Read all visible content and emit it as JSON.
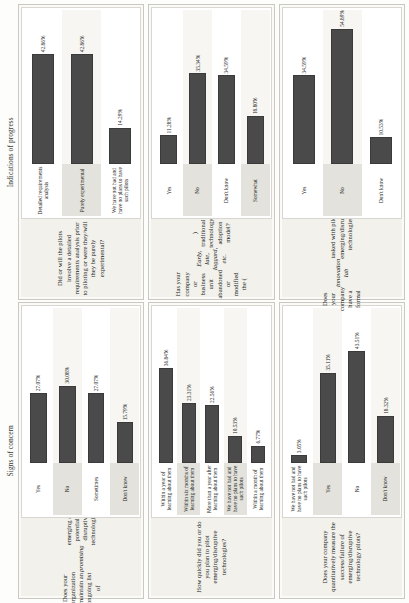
{
  "page": {
    "orientation": "rotated-90-ccw",
    "bar_color": "#4a4a4a",
    "page_background": "#fdfdfb"
  },
  "sections": [
    {
      "id": "signs-of-concern",
      "title": "Signs of concern",
      "charts": [
        {
          "id": "ongoing-list",
          "chart_data": {
            "type": "bar",
            "title": "Does your organization maintain an ongoing list of promising emerging and potentially disruptive technologies?",
            "title_parts": [
              {
                "text": "Does your organization maintain an ongoing list of ",
                "style": "normal"
              },
              {
                "text": "promising",
                "style": "italic"
              },
              {
                "text": " emerging and potentially disruptive technologies?",
                "style": "normal"
              }
            ],
            "orientation": "horizontal",
            "categories": [
              "Yes",
              "No",
              "Sometimes",
              "Don't know"
            ],
            "values": [
              27.07,
              30.08,
              27.07,
              15.79
            ],
            "labels": [
              "27.07%",
              "30.08%",
              "27.07%",
              "15.79%"
            ],
            "xlabel": "",
            "ylabel": "",
            "xlim": [
              0,
              60
            ],
            "grid": false,
            "legend": false
          }
        },
        {
          "id": "how-quickly-pilot",
          "chart_data": {
            "type": "bar",
            "title": "How quickly did you or do you plan to pilot emerging/disruptive technologies?",
            "title_parts": [
              {
                "text": "How quickly did you or do you plan to pilot emerging/disruptive technologies?",
                "style": "normal"
              }
            ],
            "orientation": "horizontal",
            "categories": [
              "Within a year of learning about them",
              "Within six months of learning about them",
              "More than a year after learning about them",
              "We have not had and have no plans to have such pilots",
              "Within a month of learning about them"
            ],
            "values": [
              36.84,
              23.31,
              22.56,
              10.53,
              6.77
            ],
            "labels": [
              "36.84%",
              "23.31%",
              "22.56%",
              "10.53%",
              "6.77%"
            ],
            "xlabel": "",
            "ylabel": "",
            "xlim": [
              0,
              60
            ],
            "grid": false,
            "legend": false
          }
        },
        {
          "id": "quantitative-measure",
          "chart_data": {
            "type": "bar",
            "title": "Does your company quantitatively measure the success/failure of emerging/disruptive technology pilots?",
            "title_parts": [
              {
                "text": "Does your company quantitatively measure the success/failure of emerging/disruptive technology pilots?",
                "style": "normal"
              }
            ],
            "orientation": "horizontal",
            "categories": [
              "We have not had and have no plans to have such pilots",
              "Yes",
              "No",
              "Don't know"
            ],
            "values": [
              3.05,
              35.11,
              43.51,
              18.32
            ],
            "labels": [
              "3.05%",
              "35.11%",
              "43.51%",
              "18.32%"
            ],
            "xlabel": "",
            "ylabel": "",
            "xlim": [
              0,
              60
            ],
            "grid": false,
            "legend": false
          }
        }
      ]
    },
    {
      "id": "indications-of-progress",
      "title": "Indications of progress",
      "charts": [
        {
          "id": "requirements-analysis",
          "chart_data": {
            "type": "bar",
            "title": "Did or will the pilots involve a detailed requirements analysis prior to piloting or were they/will they be purely experimental?",
            "title_parts": [
              {
                "text": "Did or will the pilots involve a detailed requirements analysis prior to piloting or were they/will they be purely experimental?",
                "style": "normal"
              }
            ],
            "orientation": "horizontal",
            "categories": [
              "Detailed requirements analysis",
              "Purely experimental",
              "We have not had and have no plans to have such pilots"
            ],
            "values": [
              42.86,
              42.86,
              14.29
            ],
            "labels": [
              "42.86%",
              "42.86%",
              "14.29%"
            ],
            "xlabel": "",
            "ylabel": "",
            "xlim": [
              0,
              60
            ],
            "grid": false,
            "legend": false
          }
        },
        {
          "id": "abandoned-adoption-model",
          "chart_data": {
            "type": "bar",
            "title": "Has your company or business unit abandoned or modified the (Early, late, laggard, etc.) traditional technology adoption model?",
            "title_parts": [
              {
                "text": "Has your company or business unit abandoned or modified the (",
                "style": "normal"
              },
              {
                "text": "Early, late, laggard, etc.",
                "style": "italic"
              },
              {
                "text": ") traditional technology adoption model?",
                "style": "normal"
              }
            ],
            "orientation": "horizontal",
            "categories": [
              "Yes",
              "No",
              "Don't know",
              "Somewhat"
            ],
            "values": [
              11.28,
              35.34,
              34.59,
              18.8
            ],
            "labels": [
              "11.28%",
              "35.34%",
              "34.59%",
              "18.80%"
            ],
            "xlabel": "",
            "ylabel": "",
            "xlim": [
              0,
              60
            ],
            "grid": false,
            "legend": false
          }
        },
        {
          "id": "innovation-lab",
          "chart_data": {
            "type": "bar",
            "title": "Does your company have a formal innovation lab tasked with piloting emerging/disruptive technologies?",
            "title_parts": [
              {
                "text": "Does your company have a formal ",
                "style": "normal"
              },
              {
                "text": "innovation lab",
                "style": "italic"
              },
              {
                "text": " tasked with piloting emerging/disruptive technologies?",
                "style": "normal"
              }
            ],
            "orientation": "horizontal",
            "categories": [
              "Yes",
              "No",
              "Don't know"
            ],
            "values": [
              34.59,
              54.89,
              10.53
            ],
            "labels": [
              "34.59%",
              "54.89%",
              "10.53%"
            ],
            "xlabel": "",
            "ylabel": "",
            "xlim": [
              0,
              60
            ],
            "grid": false,
            "legend": false
          }
        }
      ]
    }
  ]
}
